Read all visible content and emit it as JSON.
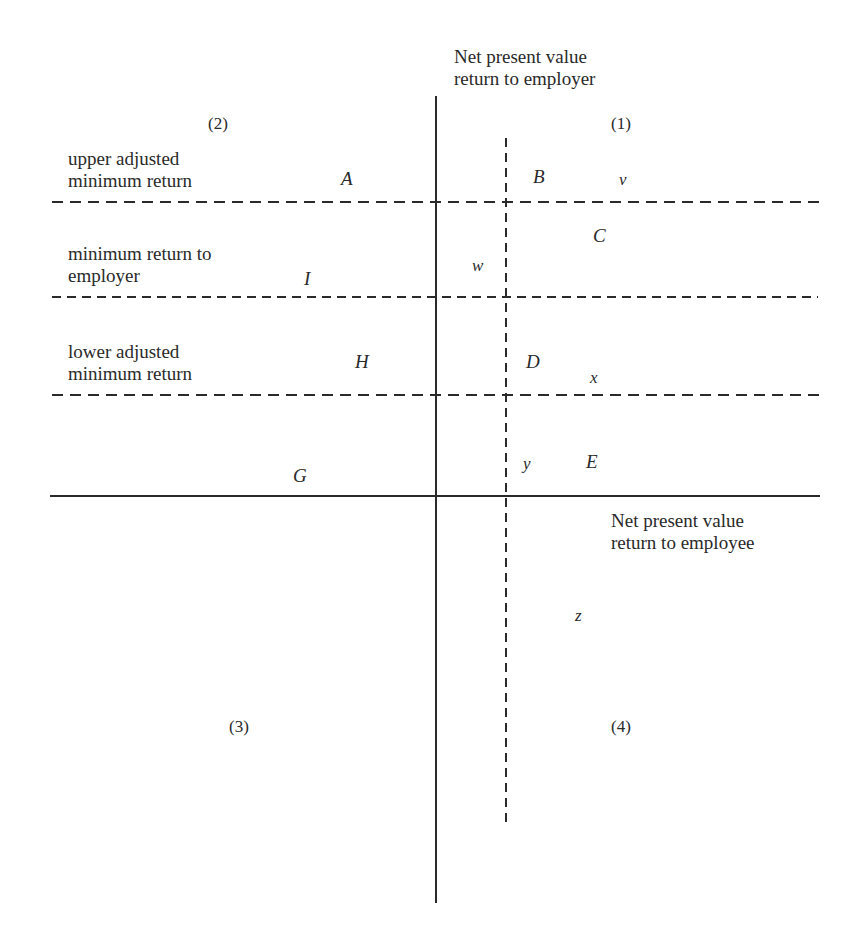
{
  "axes": {
    "vertical_label_line1": "Net present value",
    "vertical_label_line2": "return to employer",
    "horizontal_label_line1": "Net present value",
    "horizontal_label_line2": "return to employee"
  },
  "quadrants": {
    "q1": "(1)",
    "q2": "(2)",
    "q3": "(3)",
    "q4": "(4)"
  },
  "bands": [
    {
      "line1": "upper adjusted",
      "line2": "minimum return"
    },
    {
      "line1": "minimum return to",
      "line2": "employer"
    },
    {
      "line1": "lower adjusted",
      "line2": "minimum return"
    }
  ],
  "regions": {
    "A": "A",
    "B": "B",
    "C": "C",
    "D": "D",
    "E": "E",
    "G": "G",
    "H": "H",
    "I": "I",
    "v": "v",
    "w": "w",
    "x": "x",
    "y": "y",
    "z": "z"
  },
  "colors": {
    "line": "#2a2a2a",
    "background": "#ffffff"
  }
}
